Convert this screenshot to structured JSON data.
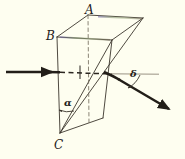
{
  "figure": {
    "name": "prism-refraction-diagram",
    "type": "optics-ray-diagram",
    "background_color": "#fefef0",
    "ink_color": "#2b2620",
    "width": 185,
    "height": 159
  },
  "vertices": [
    {
      "id": "A",
      "label": "A",
      "x": 88,
      "y": 15,
      "role": "top-rear-left-corner"
    },
    {
      "id": "B",
      "label": "B",
      "x": 57,
      "y": 37,
      "role": "top-front-left-corner"
    },
    {
      "id": "C",
      "label": "C",
      "x": 60,
      "y": 133,
      "role": "bottom-apex"
    },
    {
      "id": "R",
      "label": "",
      "x": 143,
      "y": 18,
      "role": "top-rear-right-corner"
    }
  ],
  "angles": [
    {
      "id": "alpha",
      "label": "α",
      "name": "apex-angle",
      "vertex": "C",
      "label_x": 64,
      "label_y": 98
    },
    {
      "id": "delta",
      "label": "δ",
      "name": "deviation-angle",
      "vertex": "exit-point",
      "label_x": 130,
      "label_y": 69
    }
  ],
  "rays": {
    "incident": {
      "name": "incident-ray",
      "from_x": 6,
      "from_y": 72,
      "to_x": 58,
      "to_y": 72,
      "style": "solid-thick-arrow",
      "direction": "horizontal-rightward"
    },
    "internal": {
      "name": "internal-ray",
      "from_x": 58,
      "from_y": 72,
      "to_x": 112,
      "to_y": 74,
      "style": "dashed"
    },
    "undeviated_axis": {
      "name": "undeviated-axis-line",
      "from_x": 112,
      "from_y": 74,
      "to_x": 158,
      "to_y": 74,
      "style": "thin-solid"
    },
    "emergent": {
      "name": "emergent-ray",
      "from_x": 104,
      "from_y": 72,
      "to_x": 170,
      "to_y": 110,
      "style": "solid-thick-arrow",
      "direction": "down-right"
    }
  },
  "labels": {
    "A": "A",
    "B": "B",
    "C": "C",
    "alpha": "α",
    "delta": "δ"
  }
}
